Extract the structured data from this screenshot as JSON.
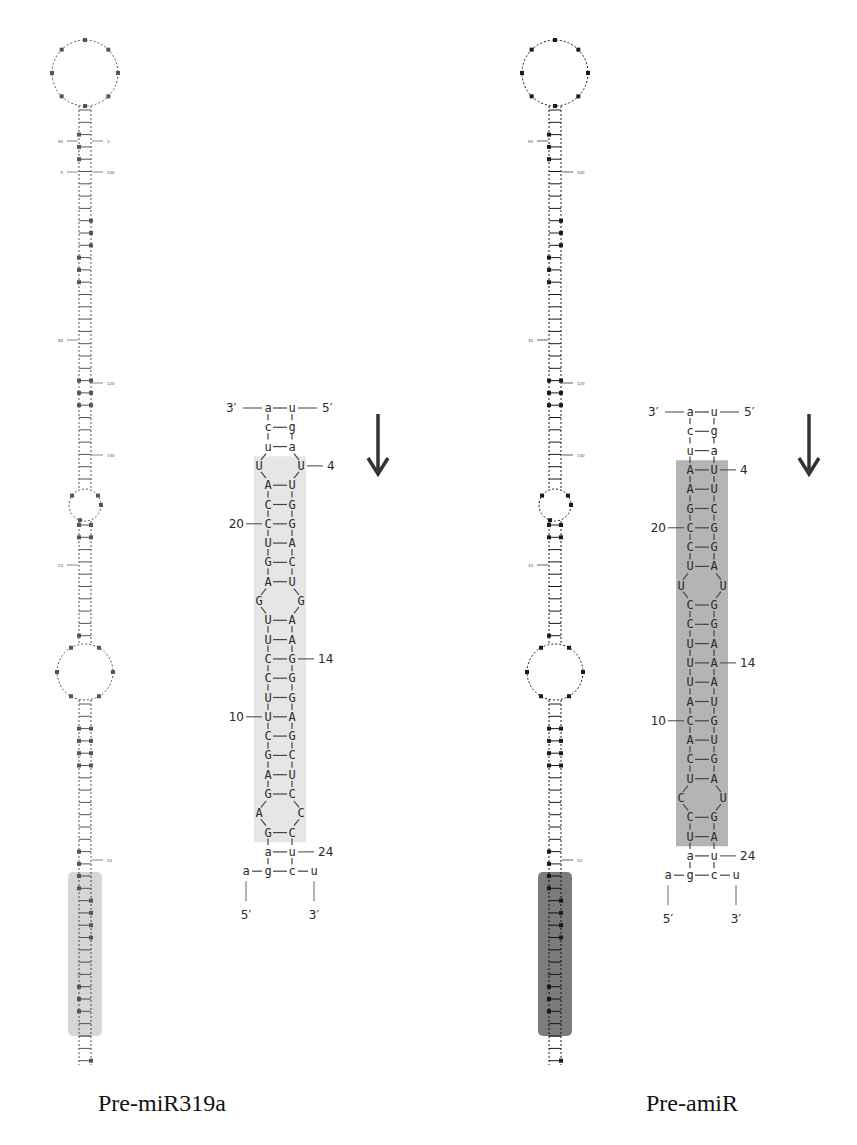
{
  "figure": {
    "title_fragment": "p",
    "panels": [
      {
        "id": "pre-miR319a",
        "caption": "Pre-miR319a",
        "highlight_color": "#e6e6e6",
        "full_hairpin_highlight_color": "#cfcfcf",
        "full_hairpin_labels": [
          "100",
          "90",
          "120",
          "80",
          "140",
          "20",
          "10",
          "5",
          "3"
        ],
        "arrow": "down-arrow",
        "detail": {
          "top_labels": {
            "left": "3′",
            "right": "5′"
          },
          "rows": [
            {
              "type": "pair",
              "l": "a",
              "r": "u",
              "top": true
            },
            {
              "type": "pair",
              "l": "c",
              "r": "g"
            },
            {
              "type": "pair",
              "l": "u",
              "r": "a"
            },
            {
              "type": "bulge",
              "l": "U",
              "r": "U",
              "rnum": "4"
            },
            {
              "type": "pair",
              "l": "A",
              "r": "U"
            },
            {
              "type": "pair",
              "l": "C",
              "r": "G"
            },
            {
              "type": "pair",
              "l": "C",
              "r": "G",
              "lnum": "20"
            },
            {
              "type": "pair",
              "l": "U",
              "r": "A"
            },
            {
              "type": "pair",
              "l": "G",
              "r": "C"
            },
            {
              "type": "pair",
              "l": "A",
              "r": "U"
            },
            {
              "type": "bulge",
              "l": "G",
              "r": "G"
            },
            {
              "type": "pair",
              "l": "U",
              "r": "A"
            },
            {
              "type": "pair",
              "l": "U",
              "r": "A"
            },
            {
              "type": "pair",
              "l": "C",
              "r": "G",
              "rnum": "14"
            },
            {
              "type": "pair",
              "l": "C",
              "r": "G"
            },
            {
              "type": "pair",
              "l": "U",
              "r": "G"
            },
            {
              "type": "pair",
              "l": "U",
              "r": "A",
              "lnum": "10"
            },
            {
              "type": "pair",
              "l": "C",
              "r": "G"
            },
            {
              "type": "pair",
              "l": "G",
              "r": "C"
            },
            {
              "type": "pair",
              "l": "A",
              "r": "U"
            },
            {
              "type": "pair",
              "l": "G",
              "r": "C"
            },
            {
              "type": "bulge",
              "l": "A",
              "r": "C"
            },
            {
              "type": "pair",
              "l": "G",
              "r": "C"
            },
            {
              "type": "pair",
              "l": "a",
              "r": "u",
              "rnum": "24"
            }
          ],
          "bottom": {
            "seq": [
              "a",
              "g",
              "c",
              "u"
            ],
            "left": "5′",
            "right": "3′"
          }
        }
      },
      {
        "id": "pre-amiR",
        "caption": "Pre-amiR",
        "highlight_color": "#b4b4b4",
        "full_hairpin_highlight_color": "#6e6e6e",
        "full_hairpin_labels": [
          "100",
          "90",
          "120",
          "40",
          "140",
          "10",
          "10"
        ],
        "arrow": "down-arrow",
        "detail": {
          "top_labels": {
            "left": "3′",
            "right": "5′"
          },
          "rows": [
            {
              "type": "pair",
              "l": "a",
              "r": "u",
              "top": true
            },
            {
              "type": "pair",
              "l": "c",
              "r": "g"
            },
            {
              "type": "pair",
              "l": "u",
              "r": "a"
            },
            {
              "type": "pair",
              "l": "A",
              "r": "U",
              "rnum": "4"
            },
            {
              "type": "pair",
              "l": "A",
              "r": "U"
            },
            {
              "type": "pair",
              "l": "G",
              "r": "C"
            },
            {
              "type": "pair",
              "l": "C",
              "r": "G",
              "lnum": "20"
            },
            {
              "type": "pair",
              "l": "C",
              "r": "G"
            },
            {
              "type": "pair",
              "l": "U",
              "r": "A"
            },
            {
              "type": "bulge",
              "l": "U",
              "r": "U"
            },
            {
              "type": "pair",
              "l": "C",
              "r": "G"
            },
            {
              "type": "pair",
              "l": "C",
              "r": "G"
            },
            {
              "type": "pair",
              "l": "U",
              "r": "A"
            },
            {
              "type": "pair",
              "l": "U",
              "r": "A",
              "rnum": "14"
            },
            {
              "type": "pair",
              "l": "U",
              "r": "A"
            },
            {
              "type": "pair",
              "l": "A",
              "r": "U"
            },
            {
              "type": "pair",
              "l": "C",
              "r": "G",
              "lnum": "10"
            },
            {
              "type": "pair",
              "l": "A",
              "r": "U"
            },
            {
              "type": "pair",
              "l": "C",
              "r": "G"
            },
            {
              "type": "pair",
              "l": "U",
              "r": "A"
            },
            {
              "type": "bulge",
              "l": "C",
              "r": "U"
            },
            {
              "type": "pair",
              "l": "C",
              "r": "G"
            },
            {
              "type": "pair",
              "l": "U",
              "r": "A"
            },
            {
              "type": "pair",
              "l": "a",
              "r": "u",
              "rnum": "24"
            }
          ],
          "bottom": {
            "seq": [
              "a",
              "g",
              "c",
              "u"
            ],
            "left": "5′",
            "right": "3′"
          }
        }
      }
    ]
  }
}
